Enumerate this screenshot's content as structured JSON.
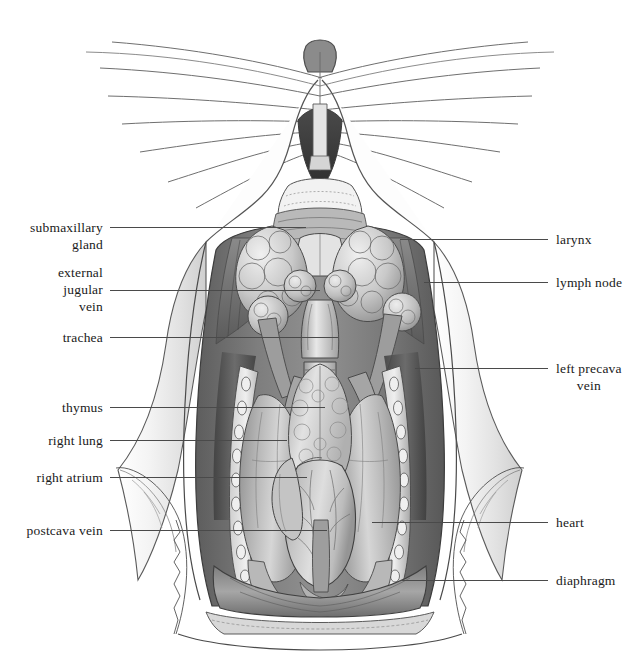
{
  "figure": {
    "background_color": "#ffffff",
    "ink_color": "#1a1a1a",
    "leader_color": "#4a4a4a",
    "width": 640,
    "height": 657
  },
  "labels_left": [
    {
      "id": "submaxillary-gland",
      "text": "submaxillary\ngland",
      "text_x": 103,
      "text_y": 219,
      "leader_x1": 110,
      "leader_x2": 306,
      "leader_y": 227
    },
    {
      "id": "external-jugular-vein",
      "text": "external\njugular\nvein",
      "text_x": 103,
      "text_y": 264,
      "leader_x1": 110,
      "leader_x2": 320,
      "leader_y": 290
    },
    {
      "id": "trachea",
      "text": "trachea",
      "text_x": 103,
      "text_y": 329,
      "leader_x1": 110,
      "leader_x2": 338,
      "leader_y": 337
    },
    {
      "id": "thymus",
      "text": "thymus",
      "text_x": 103,
      "text_y": 399,
      "leader_x1": 110,
      "leader_x2": 325,
      "leader_y": 407
    },
    {
      "id": "right-lung",
      "text": "right lung",
      "text_x": 103,
      "text_y": 432,
      "leader_x1": 110,
      "leader_x2": 287,
      "leader_y": 440
    },
    {
      "id": "right-atrium",
      "text": "right atrium",
      "text_x": 103,
      "text_y": 469,
      "leader_x1": 110,
      "leader_x2": 307,
      "leader_y": 477
    },
    {
      "id": "postcava-vein",
      "text": "postcava vein",
      "text_x": 103,
      "text_y": 522,
      "leader_x1": 110,
      "leader_x2": 327,
      "leader_y": 530
    }
  ],
  "labels_right": [
    {
      "id": "larynx",
      "text": "larynx",
      "text_x": 556,
      "text_y": 231,
      "leader_x1": 400,
      "leader_x2": 548,
      "leader_y": 239
    },
    {
      "id": "lymph-node",
      "text": "lymph node",
      "text_x": 556,
      "text_y": 274,
      "leader_x1": 424,
      "leader_x2": 548,
      "leader_y": 282
    },
    {
      "id": "left-precava-vein",
      "text": "left precava\nvein",
      "text_x": 556,
      "text_y": 360,
      "leader_x1": 415,
      "leader_x2": 548,
      "leader_y": 368
    },
    {
      "id": "heart",
      "text": "heart",
      "text_x": 556,
      "text_y": 514,
      "leader_x1": 372,
      "leader_x2": 548,
      "leader_y": 522
    },
    {
      "id": "diaphragm",
      "text": "diaphragm",
      "text_x": 556,
      "text_y": 572,
      "leader_x1": 400,
      "leader_x2": 548,
      "leader_y": 580
    }
  ]
}
